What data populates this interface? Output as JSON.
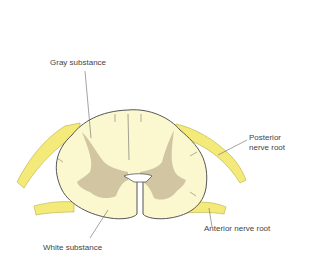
{
  "diagram": {
    "labels": {
      "gray_substance": "Gray substance",
      "posterior_nerve_root_line1": "Posterior",
      "posterior_nerve_root_line2": "nerve root",
      "anterior_nerve_root": "Anterior nerve root",
      "white_substance": "White substance"
    },
    "colors": {
      "background": "#ffffff",
      "white_matter": "#fbf8cf",
      "gray_matter": "#c9bc9a",
      "nerve_root": "#f4ea7a",
      "outline": "#555555",
      "label_text": "#444444",
      "leader_line": "#666666"
    }
  }
}
